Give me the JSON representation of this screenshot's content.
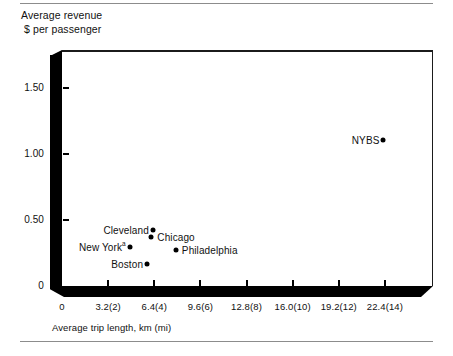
{
  "chart_data": {
    "type": "scatter",
    "title": "",
    "ylabel": "Average revenue\n $ per passenger",
    "xlabel": "Average trip length, km (mi)",
    "ylim": [
      0,
      1.75
    ],
    "xlim": [
      0,
      25.6
    ],
    "grid": false,
    "legend": "none",
    "y_ticks": [
      "0",
      "0.50",
      "1.00",
      "1.50"
    ],
    "y_tick_values": [
      0,
      0.5,
      1.0,
      1.5
    ],
    "x_ticks": [
      "0",
      "3.2(2)",
      "6.4(4)",
      "9.6(6)",
      "12.8(8)",
      "16.0(10)",
      "19.2(12)",
      "22.4(14)"
    ],
    "x_tick_values": [
      0,
      3.2,
      6.4,
      9.6,
      12.8,
      16.0,
      19.2,
      22.4
    ],
    "points": [
      {
        "label": "Cleveland",
        "x": 6.3,
        "y": 0.425,
        "label_side": "left",
        "superscript": ""
      },
      {
        "label": "Chicago",
        "x": 6.2,
        "y": 0.368,
        "label_side": "right",
        "superscript": ""
      },
      {
        "label": "New York",
        "x": 4.7,
        "y": 0.295,
        "label_side": "left",
        "superscript": "a"
      },
      {
        "label": "Philadelphia",
        "x": 7.9,
        "y": 0.27,
        "label_side": "right",
        "superscript": ""
      },
      {
        "label": "Boston",
        "x": 5.9,
        "y": 0.165,
        "label_side": "left",
        "superscript": ""
      },
      {
        "label": "NYBS",
        "x": 22.3,
        "y": 1.105,
        "label_side": "left",
        "superscript": ""
      }
    ]
  },
  "axis_titles": {
    "y_line1": "Average revenue",
    "y_line2": " $ per passenger",
    "x": "Average trip length, km (mi)"
  },
  "colors": {
    "axis": "#000000",
    "text": "#111111",
    "rule": "#8c8c8c",
    "background": "#ffffff"
  }
}
